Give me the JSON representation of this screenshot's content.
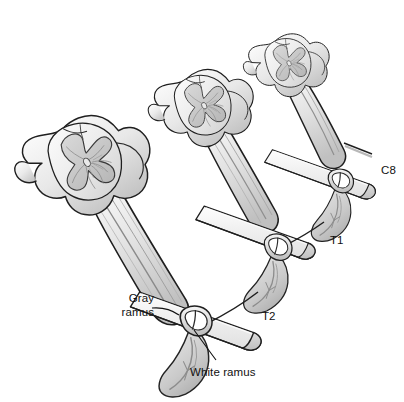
{
  "figure": {
    "background_color": "#ffffff",
    "line_color": "#1a1a1a",
    "fill_light": "#f2f2f2",
    "fill_mid": "#d8d8d8",
    "fill_dark": "#bdbdbd",
    "fill_gray_matter": "#c9c9c9",
    "label_color": "#111111"
  },
  "labels": {
    "c8": "C8",
    "t1": "T1",
    "t2": "T2",
    "gray_ramus_line1": "Gray",
    "gray_ramus_line2": "ramus",
    "white_ramus": "White ramus"
  },
  "segments": [
    {
      "id": "c8",
      "level_label": "C8",
      "position": "top-right"
    },
    {
      "id": "t1",
      "level_label": "T1",
      "position": "middle"
    },
    {
      "id": "t2",
      "level_label": "T2",
      "position": "bottom-left"
    }
  ],
  "structures": [
    {
      "name": "spinal-cord-cross-section",
      "count": 3
    },
    {
      "name": "gray-matter-butterfly",
      "count": 3
    },
    {
      "name": "central-canal",
      "count": 3
    },
    {
      "name": "dorsal-root",
      "count": 3
    },
    {
      "name": "ventral-root",
      "count": 3
    },
    {
      "name": "spinal-nerve",
      "count": 3
    },
    {
      "name": "sympathetic-chain-ganglion",
      "count": 3
    },
    {
      "name": "sympathetic-trunk",
      "count": 1
    },
    {
      "name": "gray-ramus-communicans",
      "count": 3
    },
    {
      "name": "white-ramus-communicans",
      "count": 2
    },
    {
      "name": "transverse-process-rod",
      "count": 3
    }
  ]
}
